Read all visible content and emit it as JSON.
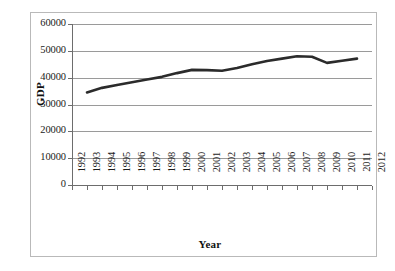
{
  "chart_data": {
    "type": "line",
    "title": "",
    "xlabel": "Year",
    "ylabel": "GDP",
    "xlim": [
      1992,
      2012
    ],
    "ylim": [
      0,
      60000
    ],
    "ytick_step": 10000,
    "grid": true,
    "legend": false,
    "legend_position": "none",
    "line_color": "#2b2b2b",
    "line_width_px": 2.6,
    "markers": false,
    "x_tick_labels": [
      "1992",
      "1993",
      "1994",
      "1995",
      "1996",
      "1997",
      "1998",
      "1999",
      "2000",
      "2001",
      "2002",
      "2003",
      "2004",
      "2005",
      "2006",
      "2007",
      "2008",
      "2009",
      "2010",
      "2011",
      "2012"
    ],
    "y_tick_labels": [
      "60000",
      "50000",
      "40000",
      "30000",
      "20000",
      "10000",
      "0"
    ],
    "y_tick_values": [
      60000,
      50000,
      40000,
      30000,
      20000,
      10000,
      0
    ],
    "x": [
      1993,
      1994,
      1995,
      1996,
      1997,
      1998,
      1999,
      2000,
      2001,
      2002,
      2003,
      2004,
      2005,
      2006,
      2007,
      2008,
      2009,
      2010,
      2011
    ],
    "values": [
      34500,
      36200,
      37300,
      38300,
      39300,
      40300,
      41700,
      42900,
      42800,
      42600,
      43600,
      45000,
      46200,
      47100,
      48000,
      47800,
      45500,
      46300,
      47100
    ],
    "series": [
      {
        "name": "GDP",
        "x": [
          1993,
          1994,
          1995,
          1996,
          1997,
          1998,
          1999,
          2000,
          2001,
          2002,
          2003,
          2004,
          2005,
          2006,
          2007,
          2008,
          2009,
          2010,
          2011
        ],
        "values": [
          34500,
          36200,
          37300,
          38300,
          39300,
          40300,
          41700,
          42900,
          42800,
          42600,
          43600,
          45000,
          46200,
          47100,
          48000,
          47800,
          45500,
          46300,
          47100
        ]
      }
    ]
  },
  "axes": {
    "y_title": "GDP",
    "x_title": "Year"
  }
}
